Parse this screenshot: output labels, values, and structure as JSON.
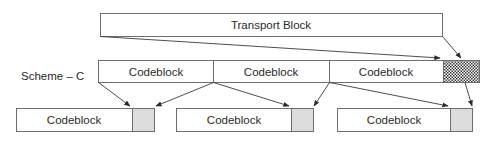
{
  "diagram": {
    "scheme_label": "Scheme – C",
    "transport_block": {
      "label": "Transport Block"
    },
    "middle_row": {
      "segments": [
        {
          "label": "Codeblock"
        },
        {
          "label": "Codeblock"
        },
        {
          "label": "Codeblock"
        }
      ],
      "tail": {
        "pattern": "hatched",
        "meaning": "transport-block-crc"
      }
    },
    "bottom_row": {
      "blocks": [
        {
          "label": "Codeblock",
          "crc_fill": "#dcdcdc"
        },
        {
          "label": "Codeblock",
          "crc_fill": "#dcdcdc"
        },
        {
          "label": "Codeblock",
          "crc_fill": "#dcdcdc"
        }
      ]
    },
    "colors": {
      "stroke": "#6e6e6e",
      "crc_fill": "#dcdcdc",
      "text": "#2a2a2a",
      "arrow": "#3a3a3a"
    }
  }
}
